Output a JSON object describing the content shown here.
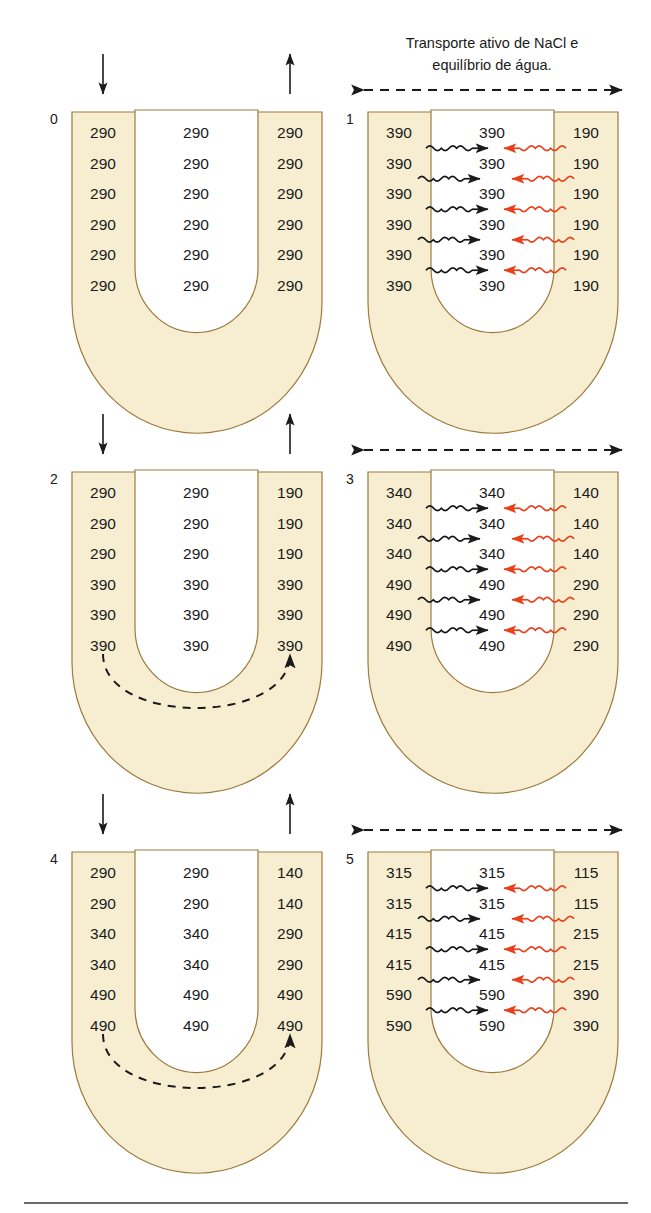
{
  "figure": {
    "caption_line1": "Transporte ativo de NaCl e",
    "caption_line2": "equilíbrio de água.",
    "colors": {
      "tube_fill": "#f7eed2",
      "tube_border": "#9c7a3c",
      "water_arrow": "#e8401a",
      "salt_arrow": "#141414",
      "text": "#1a1a1a"
    }
  },
  "panels": [
    {
      "id": "panel-0",
      "label": "0",
      "side": "left",
      "has_vertical_flow_arrows": true,
      "has_dashed_horizontal_arrow": false,
      "has_dashed_loop_arrow": false,
      "has_wavy_arrows": false,
      "rows": [
        {
          "descending": "290",
          "interstitium": "290",
          "ascending": "290"
        },
        {
          "descending": "290",
          "interstitium": "290",
          "ascending": "290"
        },
        {
          "descending": "290",
          "interstitium": "290",
          "ascending": "290"
        },
        {
          "descending": "290",
          "interstitium": "290",
          "ascending": "290"
        },
        {
          "descending": "290",
          "interstitium": "290",
          "ascending": "290"
        },
        {
          "descending": "290",
          "interstitium": "290",
          "ascending": "290"
        }
      ]
    },
    {
      "id": "panel-1",
      "label": "1",
      "side": "right",
      "has_vertical_flow_arrows": false,
      "has_dashed_horizontal_arrow": true,
      "has_dashed_loop_arrow": false,
      "has_wavy_arrows": true,
      "rows": [
        {
          "descending": "390",
          "interstitium": "390",
          "ascending": "190"
        },
        {
          "descending": "390",
          "interstitium": "390",
          "ascending": "190"
        },
        {
          "descending": "390",
          "interstitium": "390",
          "ascending": "190"
        },
        {
          "descending": "390",
          "interstitium": "390",
          "ascending": "190"
        },
        {
          "descending": "390",
          "interstitium": "390",
          "ascending": "190"
        },
        {
          "descending": "390",
          "interstitium": "390",
          "ascending": "190"
        }
      ]
    },
    {
      "id": "panel-2",
      "label": "2",
      "side": "left",
      "has_vertical_flow_arrows": true,
      "has_dashed_horizontal_arrow": false,
      "has_dashed_loop_arrow": true,
      "has_wavy_arrows": false,
      "rows": [
        {
          "descending": "290",
          "interstitium": "290",
          "ascending": "190"
        },
        {
          "descending": "290",
          "interstitium": "290",
          "ascending": "190"
        },
        {
          "descending": "290",
          "interstitium": "290",
          "ascending": "190"
        },
        {
          "descending": "390",
          "interstitium": "390",
          "ascending": "390"
        },
        {
          "descending": "390",
          "interstitium": "390",
          "ascending": "390"
        },
        {
          "descending": "390",
          "interstitium": "390",
          "ascending": "390"
        }
      ]
    },
    {
      "id": "panel-3",
      "label": "3",
      "side": "right",
      "has_vertical_flow_arrows": false,
      "has_dashed_horizontal_arrow": true,
      "has_dashed_loop_arrow": false,
      "has_wavy_arrows": true,
      "rows": [
        {
          "descending": "340",
          "interstitium": "340",
          "ascending": "140"
        },
        {
          "descending": "340",
          "interstitium": "340",
          "ascending": "140"
        },
        {
          "descending": "340",
          "interstitium": "340",
          "ascending": "140"
        },
        {
          "descending": "490",
          "interstitium": "490",
          "ascending": "290"
        },
        {
          "descending": "490",
          "interstitium": "490",
          "ascending": "290"
        },
        {
          "descending": "490",
          "interstitium": "490",
          "ascending": "290"
        }
      ]
    },
    {
      "id": "panel-4",
      "label": "4",
      "side": "left",
      "has_vertical_flow_arrows": true,
      "has_dashed_horizontal_arrow": false,
      "has_dashed_loop_arrow": true,
      "has_wavy_arrows": false,
      "rows": [
        {
          "descending": "290",
          "interstitium": "290",
          "ascending": "140"
        },
        {
          "descending": "290",
          "interstitium": "290",
          "ascending": "140"
        },
        {
          "descending": "340",
          "interstitium": "340",
          "ascending": "290"
        },
        {
          "descending": "340",
          "interstitium": "340",
          "ascending": "290"
        },
        {
          "descending": "490",
          "interstitium": "490",
          "ascending": "490"
        },
        {
          "descending": "490",
          "interstitium": "490",
          "ascending": "490"
        }
      ]
    },
    {
      "id": "panel-5",
      "label": "5",
      "side": "right",
      "has_vertical_flow_arrows": false,
      "has_dashed_horizontal_arrow": true,
      "has_dashed_loop_arrow": false,
      "has_wavy_arrows": true,
      "rows": [
        {
          "descending": "315",
          "interstitium": "315",
          "ascending": "115"
        },
        {
          "descending": "315",
          "interstitium": "315",
          "ascending": "115"
        },
        {
          "descending": "415",
          "interstitium": "415",
          "ascending": "215"
        },
        {
          "descending": "415",
          "interstitium": "415",
          "ascending": "215"
        },
        {
          "descending": "590",
          "interstitium": "590",
          "ascending": "390"
        },
        {
          "descending": "590",
          "interstitium": "590",
          "ascending": "390"
        }
      ]
    }
  ]
}
